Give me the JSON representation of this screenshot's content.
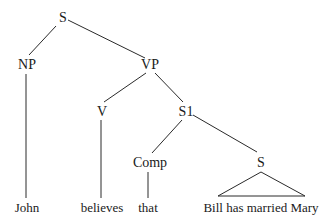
{
  "diagram": {
    "type": "syntax-tree",
    "nodes": {
      "s_root": {
        "label": "S",
        "x": 63,
        "y": 22
      },
      "np": {
        "label": "NP",
        "x": 27,
        "y": 69
      },
      "vp": {
        "label": "VP",
        "x": 150,
        "y": 69
      },
      "v": {
        "label": "V",
        "x": 102,
        "y": 116
      },
      "s1": {
        "label": "S1",
        "x": 186,
        "y": 116
      },
      "comp": {
        "label": "Comp",
        "x": 150,
        "y": 167
      },
      "s_lower": {
        "label": "S",
        "x": 261,
        "y": 167
      }
    },
    "leaves": {
      "john": {
        "label": "John",
        "x": 27,
        "y": 212
      },
      "believes": {
        "label": "believes",
        "x": 102,
        "y": 212
      },
      "that": {
        "label": "that",
        "x": 148,
        "y": 212
      },
      "bill_has_married_mary": {
        "label": "Bill has married Mary",
        "x": 261,
        "y": 212
      }
    },
    "edges": [
      {
        "from": "s_root",
        "to": "np",
        "x1": 56,
        "y1": 26,
        "x2": 29,
        "y2": 55
      },
      {
        "from": "s_root",
        "to": "vp",
        "x1": 68,
        "y1": 20,
        "x2": 145,
        "y2": 58
      },
      {
        "from": "np",
        "to": "john",
        "x1": 26,
        "y1": 74,
        "x2": 26,
        "y2": 198
      },
      {
        "from": "vp",
        "to": "v",
        "x1": 146,
        "y1": 73,
        "x2": 104,
        "y2": 102
      },
      {
        "from": "vp",
        "to": "s1",
        "x1": 155,
        "y1": 73,
        "x2": 183,
        "y2": 102
      },
      {
        "from": "v",
        "to": "believes",
        "x1": 101,
        "y1": 120,
        "x2": 101,
        "y2": 198
      },
      {
        "from": "s1",
        "to": "comp",
        "x1": 182,
        "y1": 120,
        "x2": 152,
        "y2": 153
      },
      {
        "from": "s1",
        "to": "s_lower",
        "x1": 193,
        "y1": 115,
        "x2": 257,
        "y2": 152
      },
      {
        "from": "comp",
        "to": "that",
        "x1": 148,
        "y1": 172,
        "x2": 148,
        "y2": 198
      }
    ],
    "triangle": {
      "under": "s_lower",
      "apex_x": 261,
      "apex_y": 172,
      "left_x": 218,
      "right_x": 305,
      "base_y": 196
    }
  }
}
